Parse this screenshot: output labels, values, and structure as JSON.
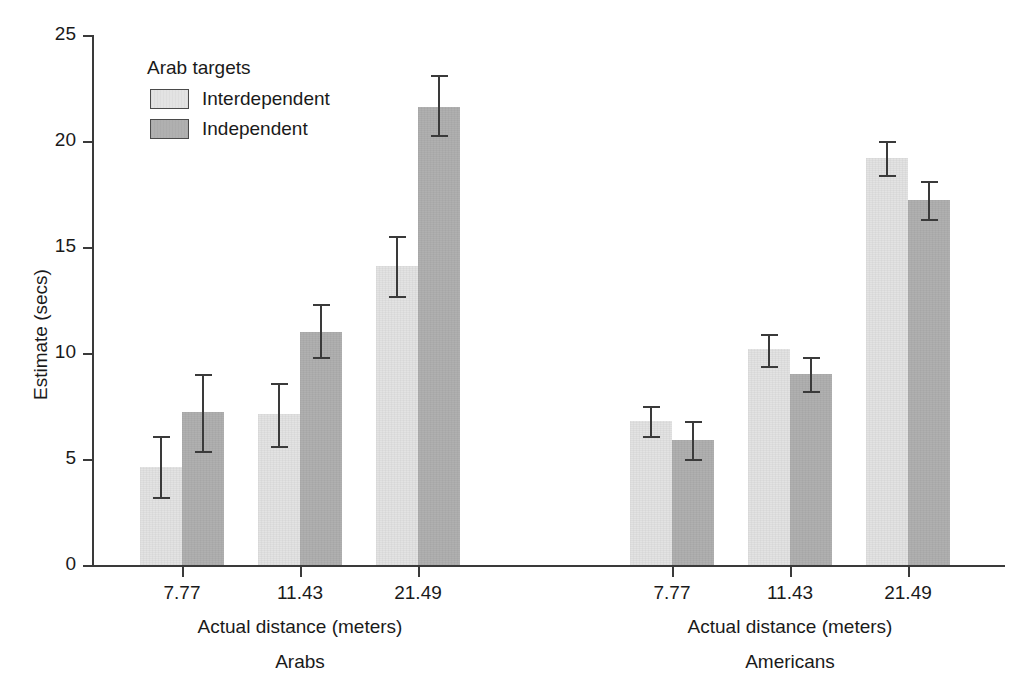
{
  "chart_data": {
    "type": "bar",
    "title": "",
    "xlabel": "Actual distance (meters)",
    "ylabel": "Estimate (secs)",
    "ylim": [
      0,
      25
    ],
    "yticks": [
      0,
      5,
      10,
      15,
      20,
      25
    ],
    "grid": false,
    "legend": {
      "title": "Arab targets",
      "position": "upper-left-inside",
      "entries": [
        "Interdependent",
        "Independent"
      ]
    },
    "categories": [
      "7.77",
      "11.43",
      "21.49"
    ],
    "panels": [
      {
        "name": "Arabs",
        "xlabel": "Actual distance (meters)",
        "categories": [
          "7.77",
          "11.43",
          "21.49"
        ],
        "series": [
          {
            "name": "Interdependent",
            "values": [
              4.6,
              7.1,
              14.1
            ],
            "err_low": [
              3.2,
              5.6,
              12.7
            ],
            "err_high": [
              6.1,
              8.6,
              15.5
            ]
          },
          {
            "name": "Independent",
            "values": [
              7.2,
              11.0,
              21.6
            ],
            "err_low": [
              5.4,
              9.8,
              20.3
            ],
            "err_high": [
              9.0,
              12.3,
              23.1
            ]
          }
        ]
      },
      {
        "name": "Americans",
        "xlabel": "Actual distance (meters)",
        "categories": [
          "7.77",
          "11.43",
          "21.49"
        ],
        "series": [
          {
            "name": "Interdependent",
            "values": [
              6.8,
              10.2,
              19.2
            ],
            "err_low": [
              6.1,
              9.4,
              18.4
            ],
            "err_high": [
              7.5,
              10.9,
              20.0
            ]
          },
          {
            "name": "Independent",
            "values": [
              5.9,
              9.0,
              17.2
            ],
            "err_low": [
              5.0,
              8.2,
              16.3
            ],
            "err_high": [
              6.8,
              9.8,
              18.1
            ]
          }
        ]
      }
    ],
    "colors": {
      "interdependent": "#e3e3e3",
      "independent": "#b0b0b0",
      "axis": "#3a3a3a",
      "text": "#1a1a1a",
      "background": "#ffffff"
    }
  }
}
